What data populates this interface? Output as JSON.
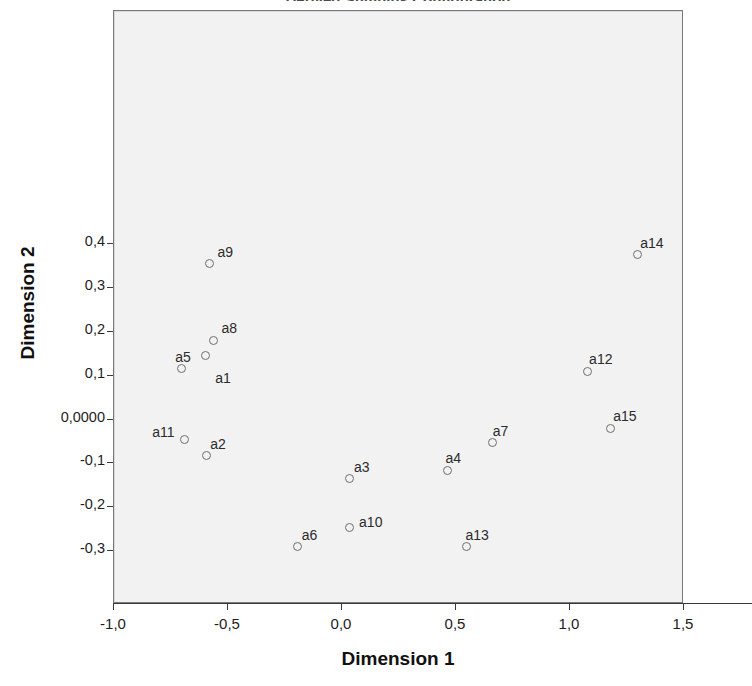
{
  "chart_data": {
    "type": "scatter",
    "title": "Derived Stimulus Configuration",
    "xlabel": "Dimension 1",
    "ylabel": "Dimension 2",
    "xlim": [
      -1.0,
      1.5
    ],
    "ylim": [
      -0.42,
      0.93
    ],
    "grid": false,
    "legend": "none",
    "decimal_separator": ",",
    "xticks": [
      "-1,0",
      "-0,5",
      "0,0",
      "0,5",
      "1,0",
      "1,5"
    ],
    "xtick_values": [
      -1.0,
      -0.5,
      0.0,
      0.5,
      1.0,
      1.5
    ],
    "yticks": [
      "0,4",
      "0,3",
      "0,2",
      "0,1",
      "0,0000",
      "-0,1",
      "-0,2",
      "-0,3"
    ],
    "ytick_values": [
      0.4,
      0.3,
      0.2,
      0.1,
      0.0,
      -0.1,
      -0.2,
      -0.3
    ],
    "marker": "open-circle",
    "marker_color": "#6e6e6e",
    "plot_background": "#f2f2f2",
    "points": [
      {
        "label": "a1",
        "x": -0.6,
        "y": 0.145,
        "lx": 10,
        "ly": 14
      },
      {
        "label": "a2",
        "x": -0.595,
        "y": -0.083,
        "lx": 4,
        "ly": -20
      },
      {
        "label": "a3",
        "x": 0.035,
        "y": -0.135,
        "lx": 4,
        "ly": -20
      },
      {
        "label": "a4",
        "x": 0.463,
        "y": -0.115,
        "lx": -2,
        "ly": -20
      },
      {
        "label": "a5",
        "x": -0.705,
        "y": 0.115,
        "lx": -6,
        "ly": -20
      },
      {
        "label": "a6",
        "x": -0.194,
        "y": -0.29,
        "lx": 4,
        "ly": -20
      },
      {
        "label": "a7",
        "x": 0.661,
        "y": -0.053,
        "lx": 0,
        "ly": -20
      },
      {
        "label": "a8",
        "x": -0.564,
        "y": 0.18,
        "lx": 8,
        "ly": -20
      },
      {
        "label": "a9",
        "x": -0.581,
        "y": 0.355,
        "lx": 8,
        "ly": -20
      },
      {
        "label": "a10",
        "x": 0.031,
        "y": -0.245,
        "lx": 10,
        "ly": -13
      },
      {
        "label": "a11",
        "x": -0.692,
        "y": -0.045,
        "lx": -32,
        "ly": -15
      },
      {
        "label": "a12",
        "x": 1.075,
        "y": 0.11,
        "lx": 2,
        "ly": -20
      },
      {
        "label": "a13",
        "x": 0.546,
        "y": -0.29,
        "lx": -1,
        "ly": -20
      },
      {
        "label": "a14",
        "x": 1.295,
        "y": 0.375,
        "lx": 3,
        "ly": -20
      },
      {
        "label": "a15",
        "x": 1.176,
        "y": -0.02,
        "lx": 3,
        "ly": -20
      }
    ]
  }
}
